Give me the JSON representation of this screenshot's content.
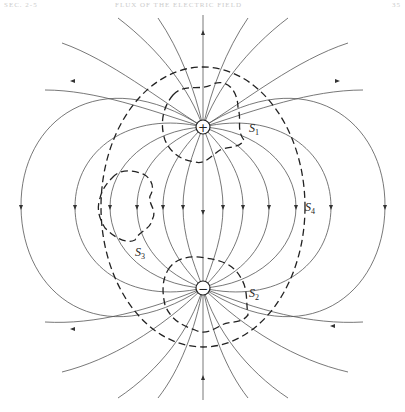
{
  "header": {
    "left": "SEC. 2-5",
    "center": "FLUX OF THE ELECTRIC FIELD",
    "right": "35"
  },
  "diagram": {
    "charges": [
      {
        "name": "positive-charge",
        "symbol": "+",
        "x": 203,
        "y": 127
      },
      {
        "name": "negative-charge",
        "symbol": "−",
        "x": 203,
        "y": 288
      }
    ],
    "surfaces": [
      {
        "label": "S",
        "sub": "1",
        "x": 249,
        "y": 132
      },
      {
        "label": "S",
        "sub": "2",
        "x": 249,
        "y": 297
      },
      {
        "label": "S",
        "sub": "3",
        "x": 135,
        "y": 256
      },
      {
        "label": "S",
        "sub": "4",
        "x": 305,
        "y": 211
      }
    ]
  }
}
